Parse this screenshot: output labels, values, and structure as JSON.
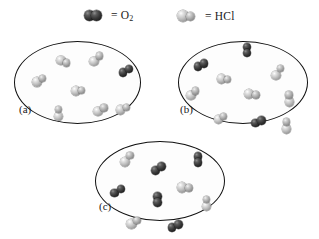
{
  "figure": {
    "type": "molecular-representation-diagram",
    "background_color": "#ffffff"
  },
  "legend": {
    "items": [
      {
        "id": "legend-o2",
        "icon_name": "o2-molecule-icon",
        "equals_text": "= O",
        "subscript": "2",
        "formula": "O2",
        "species": "oxygen",
        "atoms": [
          {
            "element": "O",
            "color": "#232323",
            "size": "large"
          },
          {
            "element": "O",
            "color": "#232323",
            "size": "large"
          }
        ]
      },
      {
        "id": "legend-hcl",
        "icon_name": "hcl-molecule-icon",
        "equals_text": "= HCl",
        "subscript": "",
        "formula": "HCl",
        "species": "hydrogen chloride",
        "atoms": [
          {
            "element": "Cl",
            "color": "#c2c2c2",
            "size": "large"
          },
          {
            "element": "H",
            "color": "#ababab",
            "size": "small"
          }
        ]
      }
    ]
  },
  "panels": [
    {
      "id": "panel-a",
      "label": "(a)",
      "counts": {
        "O2": 1,
        "HCl": 7,
        "total": 8
      },
      "molecules": [
        {
          "species": "HCl",
          "x": 95,
          "y": 22,
          "rot": -28
        },
        {
          "species": "HCl",
          "x": 48,
          "y": 46,
          "rot": 18
        },
        {
          "species": "HCl",
          "x": 160,
          "y": 20,
          "rot": 34
        },
        {
          "species": "O2",
          "x": 218,
          "y": 34,
          "rot": -20
        },
        {
          "species": "HCl",
          "x": 124,
          "y": 58,
          "rot": 8
        },
        {
          "species": "HCl",
          "x": 86,
          "y": 86,
          "rot": -52
        },
        {
          "species": "HCl",
          "x": 168,
          "y": 82,
          "rot": 22
        },
        {
          "species": "HCl",
          "x": 213,
          "y": 80,
          "rot": -14
        }
      ]
    },
    {
      "id": "panel-b",
      "label": "(b)",
      "counts": {
        "O2": 3,
        "HCl": 7,
        "total": 10
      },
      "molecules": [
        {
          "species": "O2",
          "x": 42,
          "y": 27,
          "rot": -18
        },
        {
          "species": "O2",
          "x": 131,
          "y": 10,
          "rot": 72
        },
        {
          "species": "HCl",
          "x": 86,
          "y": 44,
          "rot": 10
        },
        {
          "species": "HCl",
          "x": 190,
          "y": 36,
          "rot": -40
        },
        {
          "species": "HCl",
          "x": 26,
          "y": 62,
          "rot": 26
        },
        {
          "species": "HCl",
          "x": 140,
          "y": 62,
          "rot": -8
        },
        {
          "species": "HCl",
          "x": 212,
          "y": 68,
          "rot": 60
        },
        {
          "species": "HCl",
          "x": 80,
          "y": 92,
          "rot": 14
        },
        {
          "species": "O2",
          "x": 152,
          "y": 95,
          "rot": -12
        },
        {
          "species": "HCl",
          "x": 206,
          "y": 100,
          "rot": 30
        }
      ]
    },
    {
      "id": "panel-c",
      "label": "(c)",
      "counts": {
        "O2": 5,
        "HCl": 5,
        "total": 10
      },
      "molecules": [
        {
          "species": "HCl",
          "x": 60,
          "y": 20,
          "rot": -30
        },
        {
          "species": "O2",
          "x": 120,
          "y": 32,
          "rot": -26
        },
        {
          "species": "O2",
          "x": 196,
          "y": 22,
          "rot": 62
        },
        {
          "species": "O2",
          "x": 42,
          "y": 60,
          "rot": -22
        },
        {
          "species": "O2",
          "x": 118,
          "y": 72,
          "rot": 78
        },
        {
          "species": "HCl",
          "x": 170,
          "y": 56,
          "rot": 12
        },
        {
          "species": "HCl",
          "x": 212,
          "y": 76,
          "rot": 80
        },
        {
          "species": "HCl",
          "x": 72,
          "y": 100,
          "rot": 20
        },
        {
          "species": "O2",
          "x": 152,
          "y": 104,
          "rot": -18
        }
      ]
    }
  ]
}
